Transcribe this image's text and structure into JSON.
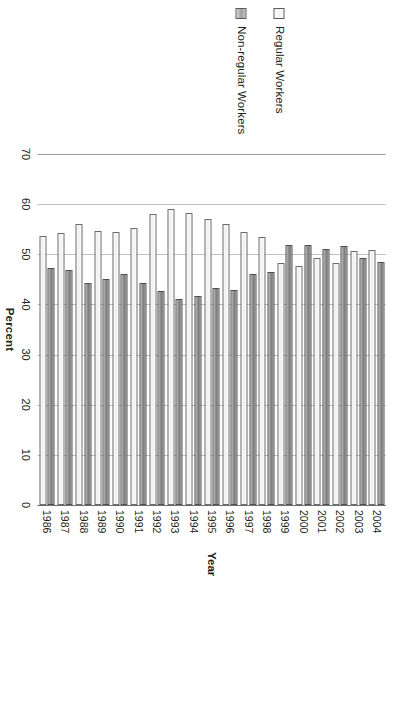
{
  "legend": {
    "position": "left",
    "items": [
      {
        "label": "Regular Workers",
        "swatch": "legend-swatch-regular",
        "color": "#f2f2f2"
      },
      {
        "label": "Non-regular Workers",
        "swatch": "legend-swatch-nonregular",
        "color": "#8f8f8f"
      }
    ]
  },
  "axes": {
    "value_title": "Percent",
    "category_title": "Year",
    "value_ticks": [
      "0",
      "10",
      "20",
      "30",
      "40",
      "50",
      "60",
      "70"
    ]
  },
  "chart_data": {
    "type": "bar",
    "orientation": "horizontal",
    "title": "",
    "xlabel": "Percent",
    "ylabel": "Year",
    "xlim": [
      0,
      70
    ],
    "grid": true,
    "legend_position": "left",
    "categories": [
      "1986",
      "1987",
      "1988",
      "1989",
      "1990",
      "1991",
      "1992",
      "1993",
      "1994",
      "1995",
      "1996",
      "1997",
      "1998",
      "1999",
      "2000",
      "2001",
      "2002",
      "2003",
      "2004"
    ],
    "series": [
      {
        "name": "Regular Workers",
        "color": "#f2f2f2",
        "values": [
          53.7,
          54.2,
          56.0,
          54.7,
          54.5,
          55.3,
          58.0,
          59.1,
          58.3,
          57.1,
          56.0,
          54.5,
          53.5,
          48.3,
          47.7,
          49.2,
          48.3,
          50.7,
          50.9
        ]
      },
      {
        "name": "Non-regular Workers",
        "color": "#8f8f8f",
        "values": [
          47.3,
          46.9,
          44.3,
          45.0,
          46.0,
          44.3,
          42.7,
          41.0,
          41.7,
          43.3,
          42.9,
          46.0,
          46.5,
          51.8,
          51.9,
          51.1,
          51.7,
          49.2,
          48.5
        ]
      }
    ]
  }
}
